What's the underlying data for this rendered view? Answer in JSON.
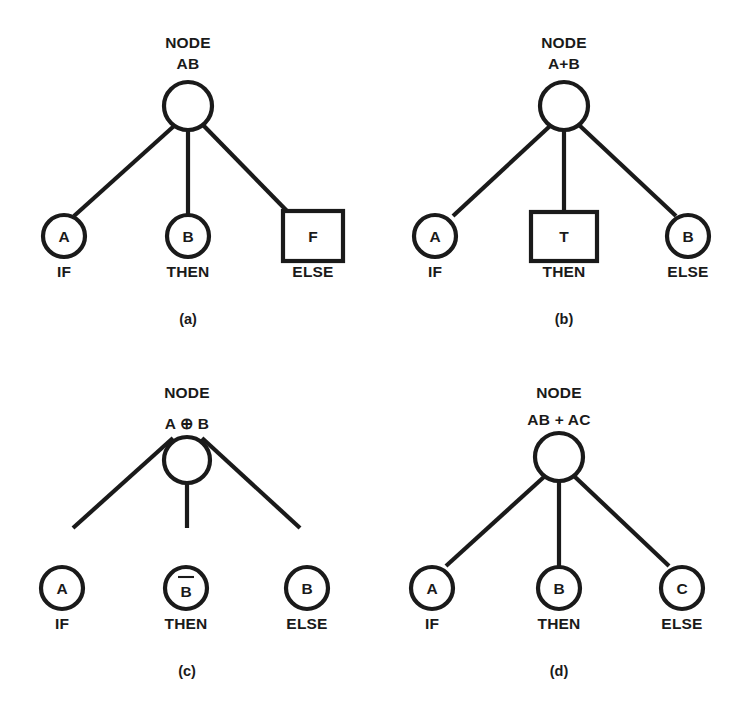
{
  "figure": {
    "background_color": "#ffffff",
    "ink_color": "#1a1a1a",
    "title": "",
    "panel_count": 4
  },
  "panels": [
    {
      "id": "a",
      "caption": "(a)",
      "node_title": "NODE",
      "node_expression": "AB",
      "node_expression_parts": [
        {
          "text": "AB",
          "overbar": false
        }
      ],
      "branches": [
        {
          "role": "IF",
          "symbol": "A",
          "symbol_overbar": false,
          "shape": "circle"
        },
        {
          "role": "THEN",
          "symbol": "B",
          "symbol_overbar": false,
          "shape": "circle"
        },
        {
          "role": "ELSE",
          "symbol": "F",
          "symbol_overbar": false,
          "shape": "square"
        }
      ]
    },
    {
      "id": "b",
      "caption": "(b)",
      "node_title": "NODE",
      "node_expression": "A+B",
      "node_expression_parts": [
        {
          "text": "A+B",
          "overbar": false
        }
      ],
      "branches": [
        {
          "role": "IF",
          "symbol": "A",
          "symbol_overbar": false,
          "shape": "circle"
        },
        {
          "role": "THEN",
          "symbol": "T",
          "symbol_overbar": false,
          "shape": "square"
        },
        {
          "role": "ELSE",
          "symbol": "B",
          "symbol_overbar": false,
          "shape": "circle"
        }
      ]
    },
    {
      "id": "c",
      "caption": "(c)",
      "node_title": "NODE",
      "node_expression": "A ⊕ B",
      "node_expression_parts": [
        {
          "text": "A ⊕ B",
          "overbar": false
        }
      ],
      "branches": [
        {
          "role": "IF",
          "symbol": "A",
          "symbol_overbar": false,
          "shape": "circle"
        },
        {
          "role": "THEN",
          "symbol": "B",
          "symbol_overbar": true,
          "shape": "circle"
        },
        {
          "role": "ELSE",
          "symbol": "B",
          "symbol_overbar": false,
          "shape": "circle"
        }
      ]
    },
    {
      "id": "d",
      "caption": "(d)",
      "node_title": "NODE",
      "node_expression": "AB + ĀC",
      "node_expression_parts": [
        {
          "text": "AB + ",
          "overbar": false
        },
        {
          "text": "A",
          "overbar": true
        },
        {
          "text": "C",
          "overbar": false
        }
      ],
      "branches": [
        {
          "role": "IF",
          "symbol": "A",
          "symbol_overbar": false,
          "shape": "circle"
        },
        {
          "role": "THEN",
          "symbol": "B",
          "symbol_overbar": false,
          "shape": "circle"
        },
        {
          "role": "ELSE",
          "symbol": "C",
          "symbol_overbar": false,
          "shape": "circle"
        }
      ]
    }
  ]
}
